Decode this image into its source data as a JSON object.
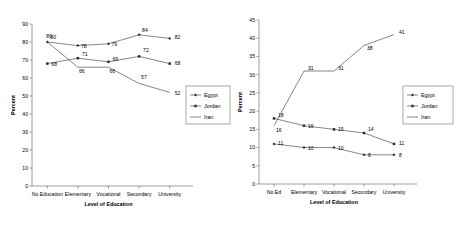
{
  "figure": {
    "panels": [
      {
        "id": "left",
        "y_axis_title": "Percent",
        "x_axis_title": "Level of Education",
        "categories": [
          "No Education",
          "Elementary",
          "Vocational",
          "Secondary",
          "University"
        ],
        "y_ticks": [
          "0",
          "10",
          "20",
          "30",
          "40",
          "50",
          "60",
          "70",
          "80",
          "90"
        ],
        "legend": [
          {
            "label": "Egypt",
            "marker": "diamond"
          },
          {
            "label": "Jordan",
            "marker": "square"
          },
          {
            "label": "Iran",
            "marker": "line"
          }
        ]
      },
      {
        "id": "right",
        "y_axis_title": "Percent",
        "x_axis_title": "Level of Education",
        "categories": [
          "No Ed",
          "Elementary",
          "Vocational",
          "Secondary",
          "University"
        ],
        "y_ticks": [
          "0",
          "5",
          "10",
          "15",
          "20",
          "25",
          "30",
          "35",
          "40",
          "45"
        ],
        "legend": [
          {
            "label": "Egypt",
            "marker": "diamond"
          },
          {
            "label": "Jordan",
            "marker": "square"
          },
          {
            "label": "Iran",
            "marker": "line"
          }
        ]
      }
    ]
  },
  "chart_data": [
    {
      "type": "line",
      "id": "left",
      "title": "",
      "xlabel": "Level of Education",
      "ylabel": "Percent",
      "categories": [
        "No Education",
        "Elementary",
        "Vocational",
        "Secondary",
        "University"
      ],
      "ylim": [
        0,
        90
      ],
      "ytick_step": 10,
      "grid": false,
      "legend_position": "right",
      "series": [
        {
          "name": "Egypt",
          "marker": "diamond",
          "values": [
            80,
            78,
            79,
            84,
            82
          ],
          "labels": [
            "80",
            "78",
            "79",
            "84",
            "82"
          ]
        },
        {
          "name": "Jordan",
          "marker": "square",
          "values": [
            68,
            71,
            69,
            72,
            68
          ],
          "labels": [
            "68",
            "71",
            "69",
            "72",
            "68"
          ]
        },
        {
          "name": "Iran",
          "marker": "none",
          "values": [
            80,
            66,
            66,
            57,
            52
          ],
          "labels": [
            "80",
            "66",
            "66",
            "57",
            "52"
          ]
        }
      ]
    },
    {
      "type": "line",
      "id": "right",
      "title": "",
      "xlabel": "Level of Education",
      "ylabel": "Percent",
      "categories": [
        "No Ed",
        "Elementary",
        "Vocational",
        "Secondary",
        "University"
      ],
      "ylim": [
        0,
        45
      ],
      "ytick_step": 5,
      "grid": false,
      "legend_position": "right",
      "series": [
        {
          "name": "Egypt",
          "marker": "diamond",
          "values": [
            11,
            10,
            10,
            8,
            8
          ],
          "labels": [
            "11",
            "10",
            "10",
            "8",
            "8"
          ]
        },
        {
          "name": "Jordan",
          "marker": "square",
          "values": [
            18,
            16,
            15,
            14,
            11
          ],
          "labels": [
            "18",
            "16",
            "15",
            "14",
            "11"
          ]
        },
        {
          "name": "Iran",
          "marker": "none",
          "values": [
            16,
            31,
            31,
            38,
            41
          ],
          "labels": [
            "16",
            "31",
            "31",
            "38",
            "41"
          ]
        }
      ]
    }
  ]
}
